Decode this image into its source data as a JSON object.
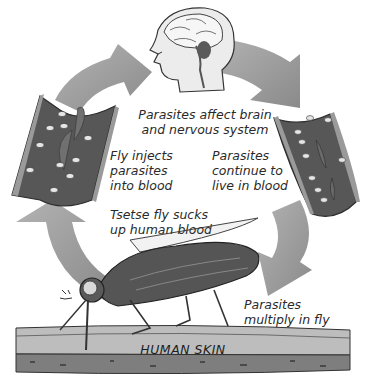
{
  "diagram": {
    "labels": {
      "brain": [
        "Parasites affect brain",
        "and nervous system"
      ],
      "inject": [
        "Fly injects",
        "parasites",
        "into blood"
      ],
      "continue": [
        "Parasites",
        "continue to",
        "live in blood"
      ],
      "sucks": [
        "Tsetse fly sucks",
        "up human blood"
      ],
      "multiply": [
        "Parasites",
        "multiply in fly"
      ],
      "skin": "HUMAN SKIN"
    },
    "stages": [
      {
        "id": "human-head",
        "icon": "human-head-brain-icon"
      },
      {
        "id": "blood-vessel-right",
        "icon": "blood-vessel-icon"
      },
      {
        "id": "tsetse-fly",
        "icon": "tsetse-fly-icon"
      },
      {
        "id": "blood-vessel-left",
        "icon": "blood-vessel-icon"
      }
    ],
    "arrows": [
      "arrow-to-head",
      "arrow-head-to-right-vessel",
      "arrow-right-vessel-to-fly",
      "arrow-fly-to-left-vessel"
    ],
    "colors": {
      "arrow": "#9a9a9a",
      "vessel_wall": "#6a6a6a",
      "vessel_inner": "#555555",
      "cell": "#e8e8e8",
      "skin_top": "#b9b9b9",
      "skin_bottom": "#7a7a7a",
      "fly_body": "#505050",
      "head_fill": "#e9e9e9"
    }
  }
}
